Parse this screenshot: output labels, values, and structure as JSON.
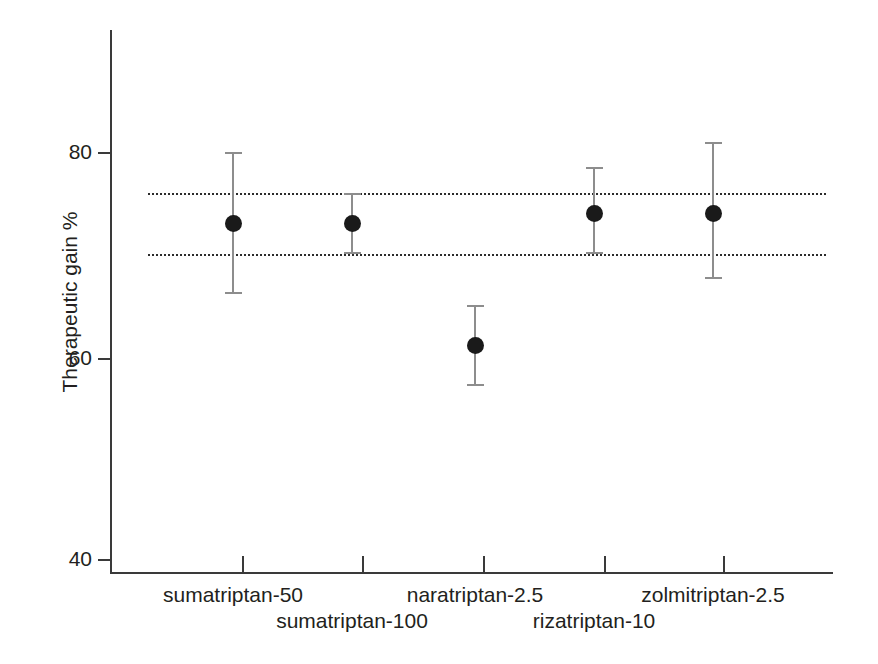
{
  "chart_data": {
    "type": "scatter",
    "title": "",
    "subtitle": "",
    "xlabel": "",
    "ylabel": "Therapeutic gain %",
    "ylim": [
      36,
      84
    ],
    "yticks": [
      40,
      60,
      80
    ],
    "ytick_labels": [
      "40",
      "60",
      "80"
    ],
    "grid": false,
    "legend": "none",
    "categories": [
      "sumatriptan-50",
      "sumatriptan-100",
      "naratriptan-2.5",
      "rizatriptan-10",
      "zolmitriptan-2.5"
    ],
    "values": [
      73,
      73,
      61,
      74,
      74
    ],
    "error_low": [
      66,
      70,
      57,
      70,
      67.5
    ],
    "error_high": [
      80,
      76,
      65,
      78.5,
      81
    ],
    "series": [
      {
        "name": "Therapeutic gain",
        "points": [
          {
            "category": "sumatriptan-50",
            "value": 73,
            "ci_low": 66,
            "ci_high": 80
          },
          {
            "category": "sumatriptan-100",
            "value": 73,
            "ci_low": 70,
            "ci_high": 76
          },
          {
            "category": "naratriptan-2.5",
            "value": 61,
            "ci_low": 57,
            "ci_high": 65
          },
          {
            "category": "rizatriptan-10",
            "value": 74,
            "ci_low": 70,
            "ci_high": 78.5
          },
          {
            "category": "zolmitriptan-2.5",
            "value": 74,
            "ci_low": 67.5,
            "ci_high": 81
          }
        ]
      }
    ],
    "reference_lines": [
      {
        "value": 76,
        "style": "dotted"
      },
      {
        "value": 70,
        "style": "dotted"
      }
    ],
    "annotations": [],
    "colors": {
      "marker": "#1a1a1a",
      "error_bar": "#8d8d8d",
      "axis": "#3a3a3a",
      "reference_line": "#2b2b2b",
      "text": "#231f20",
      "background": "#ffffff"
    }
  },
  "axis": {
    "y_title": "Therapeutic gain %",
    "y_tick_labels": [
      "80",
      "60",
      "40"
    ]
  },
  "x_labels": [
    {
      "text": "sumatriptan-50",
      "row": 0
    },
    {
      "text": "sumatriptan-100",
      "row": 1
    },
    {
      "text": "naratriptan-2.5",
      "row": 0
    },
    {
      "text": "rizatriptan-10",
      "row": 1
    },
    {
      "text": "zolmitriptan-2.5",
      "row": 0
    }
  ]
}
